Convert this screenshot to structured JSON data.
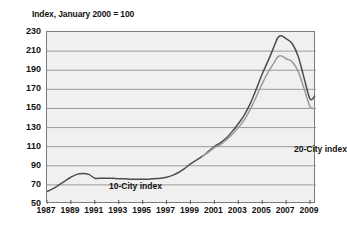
{
  "chart_data": {
    "type": "line",
    "title": "Index, January 2000 = 100",
    "xlabel": "",
    "ylabel": "",
    "xlim": [
      1987,
      2009.5
    ],
    "ylim": [
      50,
      230
    ],
    "grid": true,
    "legend_position": "inline-annotations",
    "y_ticks": [
      230,
      210,
      190,
      170,
      150,
      130,
      110,
      90,
      70,
      50
    ],
    "x_ticks": [
      1987,
      1989,
      1991,
      1993,
      1995,
      1997,
      1999,
      2001,
      2003,
      2005,
      2007,
      2009
    ],
    "series": [
      {
        "name": "10-City index",
        "color": "#4d4d4d",
        "x": [
          1987.0,
          1987.5,
          1988.0,
          1988.5,
          1989.0,
          1989.5,
          1990.0,
          1990.5,
          1991.0,
          1991.5,
          1992.0,
          1992.5,
          1993.0,
          1993.5,
          1994.0,
          1994.5,
          1995.0,
          1995.5,
          1996.0,
          1996.5,
          1997.0,
          1997.5,
          1998.0,
          1998.5,
          1999.0,
          1999.5,
          2000.0,
          2000.5,
          2001.0,
          2001.5,
          2002.0,
          2002.5,
          2003.0,
          2003.5,
          2004.0,
          2004.5,
          2005.0,
          2005.5,
          2006.0,
          2006.3,
          2006.6,
          2007.0,
          2007.5,
          2008.0,
          2008.5,
          2009.0,
          2009.4
        ],
        "values": [
          63,
          66,
          70,
          74,
          78,
          81,
          82,
          81,
          77,
          77,
          77,
          77,
          76.5,
          76.5,
          76,
          76,
          76,
          76,
          76.5,
          77,
          78,
          80,
          83,
          87,
          92,
          96,
          100,
          105,
          110,
          114,
          119,
          126,
          134,
          143,
          155,
          170,
          186,
          200,
          215,
          224,
          226,
          223,
          218,
          205,
          182,
          160,
          163
        ]
      },
      {
        "name": "20-City index",
        "color": "#9b9b9b",
        "x": [
          2000.0,
          2000.5,
          2001.0,
          2001.5,
          2002.0,
          2002.5,
          2003.0,
          2003.5,
          2004.0,
          2004.5,
          2005.0,
          2005.5,
          2006.0,
          2006.3,
          2006.6,
          2007.0,
          2007.5,
          2008.0,
          2008.5,
          2009.0,
          2009.4
        ],
        "values": [
          100,
          104,
          109,
          112,
          117,
          123,
          130,
          138,
          149,
          162,
          176,
          188,
          198,
          204,
          205,
          202,
          199,
          189,
          171,
          152,
          150
        ]
      }
    ],
    "annotations": [
      {
        "text": "10-City index",
        "x": 1991.5,
        "y": 97
      },
      {
        "text": "20-City index",
        "x": 2004.6,
        "y": 136
      }
    ]
  }
}
